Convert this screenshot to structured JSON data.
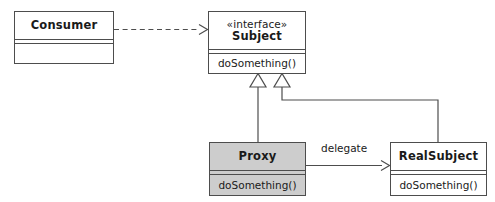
{
  "diagram": {
    "type": "uml-class-diagram",
    "background_color": "#ffffff",
    "line_color": "#4d4d4d",
    "shaded_fill": "#cdcdcd"
  },
  "classes": {
    "consumer": {
      "name": "Consumer",
      "stereotype": "",
      "members": [],
      "shaded": false
    },
    "subject": {
      "name": "Subject",
      "stereotype": "«interface»",
      "members": [
        "doSomething()"
      ],
      "shaded": false
    },
    "proxy": {
      "name": "Proxy",
      "stereotype": "",
      "members": [
        "doSomething()"
      ],
      "shaded": true
    },
    "real_subject": {
      "name": "RealSubject",
      "stereotype": "",
      "members": [
        "doSomething()"
      ],
      "shaded": false
    }
  },
  "relationships": {
    "consumer_uses_subject": {
      "label": "",
      "kind": "dependency",
      "style": "dashed",
      "arrowhead": "open"
    },
    "proxy_implements_subject": {
      "label": "",
      "kind": "realization",
      "style": "solid",
      "arrowhead": "hollow-triangle"
    },
    "realsubject_implements_subject": {
      "label": "",
      "kind": "realization",
      "style": "solid",
      "arrowhead": "hollow-triangle"
    },
    "proxy_delegates_to_realsubject": {
      "label": "delegate",
      "kind": "association",
      "style": "solid",
      "arrowhead": "open"
    }
  }
}
